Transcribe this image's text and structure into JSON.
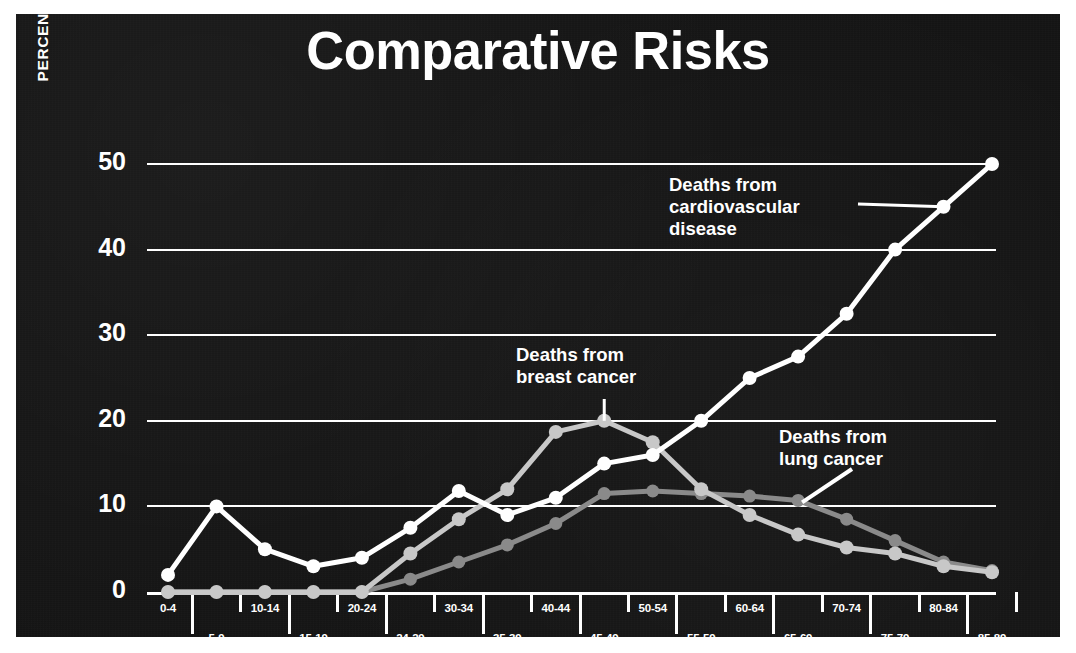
{
  "title": "Comparative Risks",
  "colors": {
    "background": "#141414",
    "frame": "#ffffff",
    "cardiovascular": "#ffffff",
    "breast_cancer": "#c8c8c8",
    "lung_cancer": "#8a8a8a",
    "text": "#ffffff",
    "gridline": "#ffffff"
  },
  "annotations": {
    "cardiovascular": "Deaths from\ncardiovascular\ndisease",
    "breast_cancer": "Deaths from\nbreast cancer",
    "lung_cancer": "Deaths from\nlung cancer"
  },
  "chart_data": {
    "type": "line",
    "title": "Comparative Risks",
    "xlabel": "",
    "ylabel": "PERCENT OF ALL DEATHS",
    "ylim": [
      0,
      50
    ],
    "yticks": [
      0,
      10,
      20,
      30,
      40,
      50
    ],
    "ytick_labels": [
      "0",
      "10",
      "20",
      "30",
      "40",
      "50"
    ],
    "grid": true,
    "legend": "annotations-on-plot",
    "categories": [
      "0-4",
      "5-9",
      "10-14",
      "15-19",
      "20-24",
      "24-29",
      "30-34",
      "35-39",
      "40-44",
      "45-49",
      "50-54",
      "55-59",
      "60-64",
      "65-69",
      "70-74",
      "75-79",
      "80-84",
      "85-89"
    ],
    "series": [
      {
        "name": "Deaths from cardiovascular disease",
        "color": "#ffffff",
        "values": [
          2,
          10,
          5,
          3,
          4,
          7.5,
          11.8,
          9,
          11,
          15,
          16,
          20,
          25,
          27.5,
          32.5,
          40,
          45,
          50
        ]
      },
      {
        "name": "Deaths from breast cancer",
        "color": "#c8c8c8",
        "values": [
          0,
          0,
          0,
          0,
          0,
          4.5,
          8.5,
          12,
          18.7,
          20,
          17.5,
          12,
          9,
          6.7,
          5.2,
          4.5,
          3,
          2.3
        ]
      },
      {
        "name": "Deaths from lung cancer",
        "color": "#8a8a8a",
        "values": [
          0,
          0,
          0,
          0,
          0,
          1.5,
          3.5,
          5.5,
          8,
          11.5,
          11.8,
          11.5,
          11.2,
          10.7,
          8.5,
          6,
          3.5,
          2.5
        ]
      }
    ]
  }
}
